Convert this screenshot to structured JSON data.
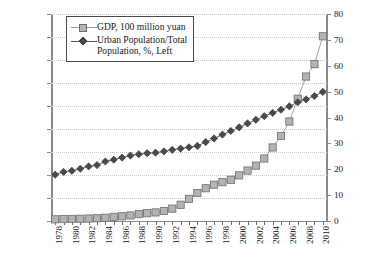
{
  "chart_data": {
    "type": "line",
    "title": "",
    "subtitle": "",
    "xlabel": "",
    "ylabel": "",
    "grid": true,
    "legend_position": "top-left",
    "x": [
      1978,
      1979,
      1980,
      1981,
      1982,
      1983,
      1984,
      1985,
      1986,
      1987,
      1988,
      1989,
      1990,
      1991,
      1992,
      1993,
      1994,
      1995,
      1996,
      1997,
      1998,
      1999,
      2000,
      2001,
      2002,
      2003,
      2004,
      2005,
      2006,
      2007,
      2008,
      2009,
      2010
    ],
    "x_tick_labels": [
      "1978",
      "1980",
      "1982",
      "1984",
      "1986",
      "1988",
      "1990",
      "1992",
      "1994",
      "1996",
      "1998",
      "2000",
      "2002",
      "2004",
      "2006",
      "2008",
      "2010"
    ],
    "left_axis": {
      "label": "",
      "ylim": [
        0,
        450000
      ],
      "step": 50000,
      "tick_labels": [
        "0",
        "50 000",
        "100 000",
        "150 000",
        "200 000",
        "250 000",
        "300 000",
        "350 000",
        "400 000",
        "450 000"
      ]
    },
    "right_axis": {
      "label": "",
      "ylim": [
        0,
        80
      ],
      "step": 10,
      "tick_labels": [
        "0",
        "10",
        "20",
        "30",
        "40",
        "50",
        "60",
        "70",
        "80"
      ]
    },
    "series": [
      {
        "name": "GDP, 100 million yuan",
        "axis": "left",
        "marker": "square",
        "color": "#b3b3b3",
        "values": [
          3645,
          4063,
          4546,
          4892,
          5323,
          5963,
          7208,
          9016,
          10275,
          12059,
          15043,
          16992,
          18668,
          21782,
          26923,
          35334,
          48198,
          60794,
          71177,
          78973,
          84402,
          89677,
          99215,
          109655,
          120333,
          135823,
          159878,
          184937,
          216314,
          265810,
          314045,
          340903,
          401513
        ]
      },
      {
        "name": "Urban Population/Total Population, %, Left",
        "axis": "right",
        "marker": "diamond",
        "color": "#4a4a4a",
        "values": [
          17.9,
          19.0,
          19.4,
          20.2,
          21.1,
          21.6,
          23.0,
          23.7,
          24.5,
          25.3,
          25.8,
          26.2,
          26.4,
          26.9,
          27.5,
          28.0,
          28.5,
          29.0,
          30.5,
          31.9,
          33.4,
          34.8,
          36.2,
          37.7,
          39.1,
          40.5,
          41.8,
          43.0,
          44.3,
          45.9,
          47.0,
          48.3,
          49.9
        ]
      }
    ]
  },
  "legend": {
    "items": [
      {
        "key": "square",
        "label": "GDP, 100 million yuan"
      },
      {
        "key": "diamond",
        "label": "Urban Population/Total\nPopulation, %, Left"
      }
    ]
  }
}
